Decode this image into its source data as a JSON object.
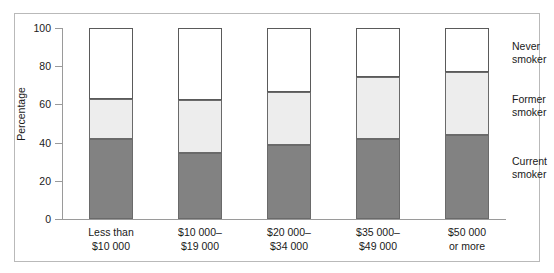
{
  "chart_data": {
    "type": "bar",
    "subtype": "stacked-bar-100-percent",
    "title": "",
    "xlabel": "",
    "ylabel": "Percentage",
    "ylim": [
      0,
      100
    ],
    "yticks": [
      0,
      20,
      40,
      60,
      80,
      100
    ],
    "ytick_labels": [
      "0",
      "20",
      "40",
      "60",
      "80",
      "100"
    ],
    "grid": false,
    "legend_position": "right",
    "categories": [
      "Less than\n$10 000",
      "$10 000–\n$19 000",
      "$20 000–\n$34 000",
      "$35 000–\n$49 000",
      "$50 000\nor more"
    ],
    "category_lines": [
      [
        "Less than",
        "$10 000"
      ],
      [
        "$10 000–",
        "$19 000"
      ],
      [
        "$20 000–",
        "$34 000"
      ],
      [
        "$35 000–",
        "$49 000"
      ],
      [
        "$50 000",
        "or more"
      ]
    ],
    "series": [
      {
        "name": "Current smoker",
        "label_lines": [
          "Current",
          "smoker"
        ],
        "color": "#828282",
        "values": [
          42,
          34.5,
          38.5,
          42,
          44
        ]
      },
      {
        "name": "Former smoker",
        "label_lines": [
          "Former",
          "smoker"
        ],
        "color": "#ededed",
        "values": [
          21,
          28,
          28,
          32.5,
          33
        ]
      },
      {
        "name": "Never smoker",
        "label_lines": [
          "Never",
          "smoker"
        ],
        "color": "#ffffff",
        "values": [
          37,
          37.5,
          33.5,
          25.5,
          23
        ]
      }
    ],
    "cumulative_tops": [
      [
        42,
        63,
        100
      ],
      [
        34.5,
        62.5,
        100
      ],
      [
        38.5,
        66.5,
        100
      ],
      [
        42,
        74.5,
        100
      ],
      [
        44,
        77,
        100
      ]
    ]
  },
  "axis": {
    "y_title": "Percentage",
    "ticks": [
      {
        "value": 100,
        "label": "100"
      },
      {
        "value": 80,
        "label": "80"
      },
      {
        "value": 60,
        "label": "60"
      },
      {
        "value": 40,
        "label": "40"
      },
      {
        "value": 20,
        "label": "20"
      },
      {
        "value": 0,
        "label": "0"
      }
    ]
  },
  "legend": {
    "entries": [
      {
        "line1": "Never",
        "line2": "smoker"
      },
      {
        "line1": "Former",
        "line2": "smoker"
      },
      {
        "line1": "Current",
        "line2": "smoker"
      }
    ]
  },
  "colors": {
    "current_smoker": "#828282",
    "former_smoker": "#ededed",
    "never_smoker": "#ffffff",
    "axis": "#9a9a9a",
    "frame": "#b9b9b9",
    "text": "#1a1a1a"
  }
}
